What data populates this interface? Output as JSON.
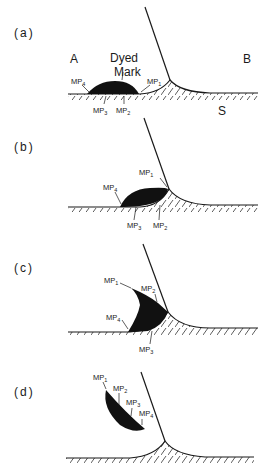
{
  "figure": {
    "panels": [
      {
        "id": "a",
        "label": "(a)",
        "regions": {
          "left": "A",
          "right": "B",
          "substrate": "S"
        },
        "mark_label_line1": "Dyed",
        "mark_label_line2": "Mark",
        "markers": [
          {
            "name": "MP",
            "sub": "1"
          },
          {
            "name": "MP",
            "sub": "2"
          },
          {
            "name": "MP",
            "sub": "3"
          },
          {
            "name": "MP",
            "sub": "4"
          }
        ]
      },
      {
        "id": "b",
        "label": "(b)",
        "markers": [
          {
            "name": "MP",
            "sub": "1"
          },
          {
            "name": "MP",
            "sub": "2"
          },
          {
            "name": "MP",
            "sub": "3"
          },
          {
            "name": "MP",
            "sub": "4"
          }
        ]
      },
      {
        "id": "c",
        "label": "(c)",
        "markers": [
          {
            "name": "MP",
            "sub": "1"
          },
          {
            "name": "MP",
            "sub": "2"
          },
          {
            "name": "MP",
            "sub": "3"
          },
          {
            "name": "MP",
            "sub": "4"
          }
        ]
      },
      {
        "id": "d",
        "label": "(d)",
        "markers": [
          {
            "name": "MP",
            "sub": "1"
          },
          {
            "name": "MP",
            "sub": "2"
          },
          {
            "name": "MP",
            "sub": "3"
          },
          {
            "name": "MP",
            "sub": "4"
          }
        ]
      }
    ],
    "colors": {
      "ink": "#1a1a1a",
      "mark": "#111111",
      "background": "#ffffff"
    }
  }
}
